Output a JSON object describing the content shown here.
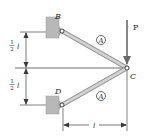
{
  "figure": {
    "type": "truss-two-bar"
  },
  "points": {
    "B": {
      "label": "B"
    },
    "C": {
      "label": "C"
    },
    "D": {
      "label": "D"
    }
  },
  "members": [
    {
      "name": "BC",
      "material_label": "A"
    },
    {
      "name": "DC",
      "material_label": "A"
    }
  ],
  "load": {
    "label": "P",
    "direction": "down"
  },
  "dimensions": {
    "upper_vertical": {
      "num": "1",
      "den": "2",
      "var": "l"
    },
    "lower_vertical": {
      "num": "1",
      "den": "2",
      "var": "l"
    },
    "horizontal": {
      "var": "l"
    }
  },
  "colors": {
    "member_fill": "#c9c9c9",
    "member_edge": "#8a8a8a",
    "wall_fill": "#b8b8b8",
    "line": "#3a3a3a",
    "text": "#2a2a2a"
  }
}
